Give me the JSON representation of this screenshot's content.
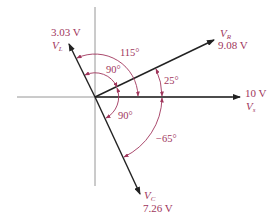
{
  "colors": {
    "axis": "#8a8a8a",
    "phasor": "#222222",
    "annotation": "#a0365c",
    "background": "#ffffff"
  },
  "diagram": {
    "type": "phasor-diagram",
    "phasors": [
      {
        "id": "VL",
        "symbol": "V",
        "subscript": "L",
        "magnitude_label": "3.03 V",
        "angle_deg": 115
      },
      {
        "id": "VR",
        "symbol": "V",
        "subscript": "R",
        "magnitude_label": "9.08 V",
        "angle_deg": 25
      },
      {
        "id": "Vs",
        "symbol": "V",
        "subscript": "s",
        "magnitude_label": "10 V",
        "angle_deg": 0
      },
      {
        "id": "VC",
        "symbol": "V",
        "subscript": "C",
        "magnitude_label": "7.26 V",
        "angle_deg": -65
      }
    ],
    "angle_annotations": [
      {
        "id": "vl-to-vs",
        "label": "115°"
      },
      {
        "id": "vl-to-vr",
        "label": "90°"
      },
      {
        "id": "vr-to-vs",
        "label": "25°"
      },
      {
        "id": "vr-to-vc",
        "label": "90°"
      },
      {
        "id": "vs-to-vc",
        "label": "−65°"
      }
    ]
  },
  "labels": {
    "vl_mag": "3.03 V",
    "vl_sym": "V",
    "vl_sub": "L",
    "vr_sym": "V",
    "vr_sub": "R",
    "vr_mag": "9.08 V",
    "vs_mag": "10 V",
    "vs_sym": "V",
    "vs_sub": "s",
    "vc_sym": "V",
    "vc_sub": "C",
    "vc_mag": "7.26 V",
    "ang_115": "115°",
    "ang_90_upper": "90°",
    "ang_25": "25°",
    "ang_90_lower": "90°",
    "ang_neg65": "−65°"
  }
}
